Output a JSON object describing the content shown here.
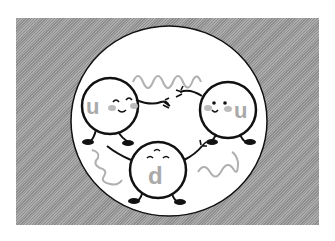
{
  "illustration": {
    "subject": "proton composed of three quarks holding hands",
    "colors": {
      "background_panel": "#9a9a9a",
      "circle_fill": "#ffffff",
      "outline": "#111111",
      "label_gray": "#a9a9a9",
      "gluon_wave": "#b0b0b0",
      "cheek": "#bdbdbd"
    },
    "quarks": [
      {
        "label": "u",
        "position": "top-left",
        "expression": "smiling, eyes closed"
      },
      {
        "label": "u",
        "position": "top-right",
        "expression": "smiling, eyes open"
      },
      {
        "label": "d",
        "position": "bottom-center",
        "expression": "content, eyes closed"
      }
    ]
  }
}
